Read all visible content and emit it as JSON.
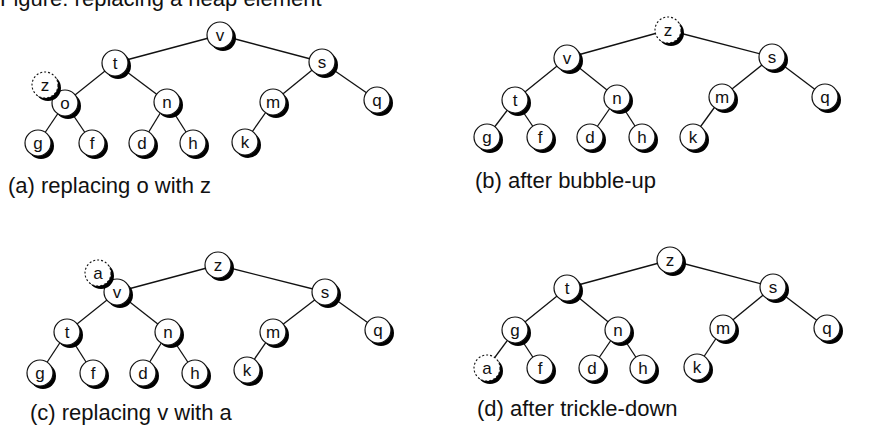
{
  "figure": {
    "partial_title": "Figure: replacing a heap element"
  },
  "style": {
    "node_radius": 13,
    "shadow_offset": 3,
    "line_color": "#111111",
    "node_fill": "#ffffff",
    "shadow_color": "#000000"
  },
  "panels": [
    {
      "id": "a",
      "caption": "(a) replacing o with z",
      "caption_pos": [
        8,
        173
      ],
      "nodes": [
        {
          "id": "v",
          "label": "v",
          "x": 220,
          "y": 35
        },
        {
          "id": "t",
          "label": "t",
          "x": 115,
          "y": 63
        },
        {
          "id": "s",
          "label": "s",
          "x": 322,
          "y": 62
        },
        {
          "id": "o",
          "label": "o",
          "x": 65,
          "y": 103
        },
        {
          "id": "n",
          "label": "n",
          "x": 167,
          "y": 102
        },
        {
          "id": "m",
          "label": "m",
          "x": 273,
          "y": 102
        },
        {
          "id": "q",
          "label": "q",
          "x": 377,
          "y": 100
        },
        {
          "id": "g",
          "label": "g",
          "x": 38,
          "y": 143
        },
        {
          "id": "f",
          "label": "f",
          "x": 92,
          "y": 143
        },
        {
          "id": "d",
          "label": "d",
          "x": 142,
          "y": 143
        },
        {
          "id": "h",
          "label": "h",
          "x": 193,
          "y": 143
        },
        {
          "id": "k",
          "label": "k",
          "x": 245,
          "y": 142
        },
        {
          "id": "z",
          "label": "z",
          "x": 45,
          "y": 85,
          "dashed": true
        }
      ],
      "edges": [
        [
          "v",
          "t"
        ],
        [
          "v",
          "s"
        ],
        [
          "t",
          "o"
        ],
        [
          "t",
          "n"
        ],
        [
          "s",
          "m"
        ],
        [
          "s",
          "q"
        ],
        [
          "o",
          "g"
        ],
        [
          "o",
          "f"
        ],
        [
          "n",
          "d"
        ],
        [
          "n",
          "h"
        ],
        [
          "m",
          "k"
        ]
      ]
    },
    {
      "id": "b",
      "caption": "(b) after bubble-up",
      "caption_pos": [
        475,
        168
      ],
      "nodes": [
        {
          "id": "z",
          "label": "z",
          "x": 668,
          "y": 30,
          "dashed": true
        },
        {
          "id": "v",
          "label": "v",
          "x": 567,
          "y": 58
        },
        {
          "id": "s",
          "label": "s",
          "x": 772,
          "y": 57
        },
        {
          "id": "t",
          "label": "t",
          "x": 515,
          "y": 100
        },
        {
          "id": "n",
          "label": "n",
          "x": 617,
          "y": 98
        },
        {
          "id": "m",
          "label": "m",
          "x": 722,
          "y": 97
        },
        {
          "id": "q",
          "label": "q",
          "x": 825,
          "y": 97
        },
        {
          "id": "g",
          "label": "g",
          "x": 487,
          "y": 137
        },
        {
          "id": "f",
          "label": "f",
          "x": 540,
          "y": 137
        },
        {
          "id": "d",
          "label": "d",
          "x": 590,
          "y": 137
        },
        {
          "id": "h",
          "label": "h",
          "x": 642,
          "y": 137
        },
        {
          "id": "k",
          "label": "k",
          "x": 693,
          "y": 137
        }
      ],
      "edges": [
        [
          "z",
          "v"
        ],
        [
          "z",
          "s"
        ],
        [
          "v",
          "t"
        ],
        [
          "v",
          "n"
        ],
        [
          "s",
          "m"
        ],
        [
          "s",
          "q"
        ],
        [
          "t",
          "g"
        ],
        [
          "t",
          "f"
        ],
        [
          "n",
          "d"
        ],
        [
          "n",
          "h"
        ],
        [
          "m",
          "k"
        ]
      ]
    },
    {
      "id": "c",
      "caption": "(c) replacing v with a",
      "caption_pos": [
        30,
        400
      ],
      "nodes": [
        {
          "id": "z",
          "label": "z",
          "x": 218,
          "y": 265
        },
        {
          "id": "v",
          "label": "v",
          "x": 117,
          "y": 292
        },
        {
          "id": "s",
          "label": "s",
          "x": 325,
          "y": 292
        },
        {
          "id": "t",
          "label": "t",
          "x": 67,
          "y": 332
        },
        {
          "id": "n",
          "label": "n",
          "x": 168,
          "y": 332
        },
        {
          "id": "m",
          "label": "m",
          "x": 273,
          "y": 332
        },
        {
          "id": "q",
          "label": "q",
          "x": 378,
          "y": 330
        },
        {
          "id": "g",
          "label": "g",
          "x": 40,
          "y": 373
        },
        {
          "id": "f",
          "label": "f",
          "x": 93,
          "y": 373
        },
        {
          "id": "d",
          "label": "d",
          "x": 143,
          "y": 373
        },
        {
          "id": "h",
          "label": "h",
          "x": 195,
          "y": 373
        },
        {
          "id": "k",
          "label": "k",
          "x": 247,
          "y": 370
        },
        {
          "id": "a",
          "label": "a",
          "x": 98,
          "y": 273,
          "dashed": true
        }
      ],
      "edges": [
        [
          "z",
          "v"
        ],
        [
          "z",
          "s"
        ],
        [
          "v",
          "t"
        ],
        [
          "v",
          "n"
        ],
        [
          "s",
          "m"
        ],
        [
          "s",
          "q"
        ],
        [
          "t",
          "g"
        ],
        [
          "t",
          "f"
        ],
        [
          "n",
          "d"
        ],
        [
          "n",
          "h"
        ],
        [
          "m",
          "k"
        ]
      ]
    },
    {
      "id": "d",
      "caption": "(d) after trickle-down",
      "caption_pos": [
        477,
        396
      ],
      "nodes": [
        {
          "id": "z",
          "label": "z",
          "x": 670,
          "y": 260
        },
        {
          "id": "t",
          "label": "t",
          "x": 567,
          "y": 288
        },
        {
          "id": "s",
          "label": "s",
          "x": 773,
          "y": 287
        },
        {
          "id": "g",
          "label": "g",
          "x": 515,
          "y": 330
        },
        {
          "id": "n",
          "label": "n",
          "x": 618,
          "y": 330
        },
        {
          "id": "m",
          "label": "m",
          "x": 723,
          "y": 328
        },
        {
          "id": "q",
          "label": "q",
          "x": 827,
          "y": 328
        },
        {
          "id": "a",
          "label": "a",
          "x": 487,
          "y": 368,
          "dashed": true
        },
        {
          "id": "f",
          "label": "f",
          "x": 540,
          "y": 368
        },
        {
          "id": "d",
          "label": "d",
          "x": 592,
          "y": 368
        },
        {
          "id": "h",
          "label": "h",
          "x": 643,
          "y": 368
        },
        {
          "id": "k",
          "label": "k",
          "x": 697,
          "y": 367
        }
      ],
      "edges": [
        [
          "z",
          "t"
        ],
        [
          "z",
          "s"
        ],
        [
          "t",
          "g"
        ],
        [
          "t",
          "n"
        ],
        [
          "s",
          "m"
        ],
        [
          "s",
          "q"
        ],
        [
          "g",
          "a"
        ],
        [
          "g",
          "f"
        ],
        [
          "n",
          "d"
        ],
        [
          "n",
          "h"
        ],
        [
          "m",
          "k"
        ]
      ]
    }
  ]
}
